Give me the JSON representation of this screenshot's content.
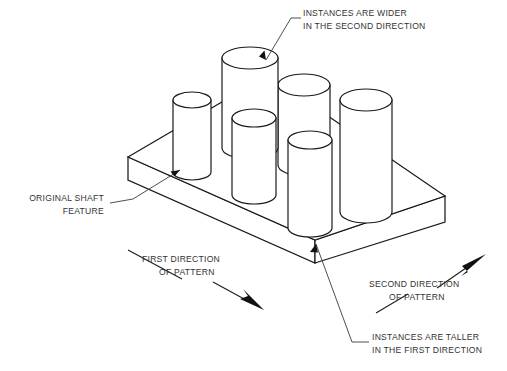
{
  "figure": {
    "kind": "isometric-cad-line-drawing",
    "background_color": "#ffffff",
    "line_color": "#1a1a1a",
    "text_color": "#333333"
  },
  "annotations": {
    "wider": {
      "line1": "INSTANCES ARE WIDER",
      "line2": "IN THE SECOND DIRECTION",
      "align": "left",
      "x": 303,
      "y1": 16,
      "y2": 29
    },
    "original": {
      "line1": "ORIGINAL SHAFT",
      "line2": "FEATURE",
      "align": "right",
      "x": 104,
      "y1": 201,
      "y2": 214
    },
    "first_direction": {
      "line1": "FIRST DIRECTION",
      "line2": "OF PATTERN",
      "align": "left",
      "x": 142,
      "y1": 262,
      "y2": 275
    },
    "second_direction": {
      "line1": "SECOND DIRECTION",
      "line2": "OF PATTERN",
      "align": "left",
      "x": 369,
      "y1": 287,
      "y2": 300
    },
    "taller": {
      "line1": "INSTANCES ARE TALLER",
      "line2": "IN THE FIRST DIRECTION",
      "align": "left",
      "x": 372,
      "y1": 340,
      "y2": 353
    }
  },
  "plate": {
    "name": "base-plate",
    "top_face": "128,157 268,75 445,196 315,240",
    "front_left_face": "128,157 128,180 315,263 315,240",
    "front_right_face": "315,240 315,263 445,222 445,196",
    "thickness_px": 23
  },
  "cylinders": [
    {
      "name": "shaft-original",
      "cx": 192,
      "cy": 172,
      "rx": 19,
      "ry": 8,
      "h": 72,
      "note": "original shaft feature"
    },
    {
      "name": "shaft-row1-col2",
      "cx": 250,
      "cy": 148,
      "rx": 28,
      "ry": 11,
      "h": 90,
      "note": "wider in second direction"
    },
    {
      "name": "shaft-row1-col3",
      "cx": 304,
      "cy": 165,
      "rx": 26,
      "ry": 11,
      "h": 80,
      "note": "back right"
    },
    {
      "name": "shaft-row1-col4",
      "cx": 366,
      "cy": 212,
      "rx": 26,
      "ry": 11,
      "h": 112,
      "note": "front right wide"
    },
    {
      "name": "shaft-row2-col2",
      "cx": 254,
      "cy": 195,
      "rx": 22,
      "ry": 9,
      "h": 77,
      "note": "front middle"
    },
    {
      "name": "shaft-row2-col3-tall",
      "cx": 310,
      "cy": 228,
      "rx": 22,
      "ry": 9,
      "h": 88,
      "note": "taller in first direction"
    }
  ],
  "leaders": [
    {
      "name": "leader-wider",
      "path": "M 300,18 L 290,18 L 264,62",
      "arrow_at": [
        264,
        62
      ],
      "arrow_angle": 120
    },
    {
      "name": "leader-original",
      "path": "M 110,203 L 133,199 L 192,168",
      "arrow_at": [
        192,
        168
      ],
      "arrow_angle": -28
    },
    {
      "name": "leader-taller",
      "path": "M 369,342 L 352,342 L 315,241",
      "arrow_at": [
        315,
        241
      ],
      "arrow_angle": -110
    }
  ],
  "direction_arrows": [
    {
      "name": "first-direction-arrow",
      "tail_line": "M 130,250 L 182,278",
      "arrow_line": "M 215,283 L 252,303",
      "tip": [
        262,
        308
      ],
      "angle_deg": 28
    },
    {
      "name": "second-direction-arrow",
      "tail_line": "M 378,312 L 410,294",
      "arrow_line": "M 440,285 L 472,262",
      "tip": [
        482,
        255
      ],
      "angle_deg": -36
    }
  ]
}
